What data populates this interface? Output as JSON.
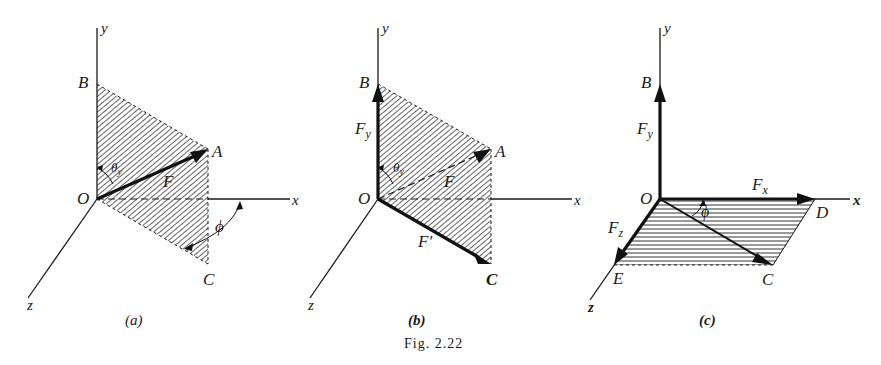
{
  "figure": {
    "caption": "Fig. 2.22",
    "top_fragment": "... components of a vector along the three axes ...",
    "panels": [
      {
        "id": "a",
        "label": "(a)",
        "axes": {
          "x": "x",
          "y": "y",
          "z": "z"
        },
        "points": {
          "origin": "O",
          "B": "B",
          "A": "A",
          "C": "C"
        },
        "vectors": [
          {
            "name": "F",
            "from": "O",
            "to": "A",
            "style": "solid-thick"
          }
        ],
        "angles": [
          {
            "symbol": "θ",
            "subscript": "y",
            "between": [
              "y-axis",
              "F"
            ]
          },
          {
            "symbol": "ϕ",
            "between": [
              "x-axis",
              "OC plane"
            ]
          }
        ],
        "shaded_plane": "OBAC (diagonal hatch)"
      },
      {
        "id": "b",
        "label": "(b)",
        "axes": {
          "x": "x",
          "y": "y",
          "z": "z"
        },
        "points": {
          "origin": "O",
          "B": "B",
          "A": "A",
          "C": "C"
        },
        "vectors": [
          {
            "name": "F",
            "subscript": "y",
            "from": "O",
            "to": "B",
            "style": "solid-thick"
          },
          {
            "name": "F",
            "from": "O",
            "to": "A",
            "style": "dashed"
          },
          {
            "name": "F′",
            "from": "O",
            "to": "C",
            "style": "solid-thick"
          }
        ],
        "angles": [
          {
            "symbol": "θ",
            "subscript": "y",
            "between": [
              "y-axis",
              "F"
            ]
          }
        ],
        "shaded_plane": "OBAC (diagonal hatch)"
      },
      {
        "id": "c",
        "label": "(c)",
        "axes": {
          "x": "x",
          "y": "y",
          "z": "z"
        },
        "points": {
          "origin": "O",
          "B": "B",
          "C": "C",
          "D": "D",
          "E": "E"
        },
        "vectors": [
          {
            "name": "F",
            "subscript": "y",
            "from": "O",
            "to": "B",
            "style": "solid-thick"
          },
          {
            "name": "F",
            "subscript": "x",
            "from": "O",
            "to": "D",
            "style": "solid-thick"
          },
          {
            "name": "F",
            "subscript": "z",
            "from": "O",
            "to": "E",
            "style": "solid-thick"
          },
          {
            "name": "",
            "from": "O",
            "to": "C",
            "style": "solid-medium"
          }
        ],
        "angles": [
          {
            "symbol": "ϕ",
            "between": [
              "x-axis",
              "OC"
            ]
          }
        ],
        "shaded_plane": "ODCE (horizontal hatch)"
      }
    ]
  },
  "text": {
    "x": "x",
    "y": "y",
    "z": "z",
    "O": "O",
    "A": "A",
    "B": "B",
    "C": "C",
    "D": "D",
    "E": "E",
    "F": "F",
    "Fprime": "F′",
    "theta": "θ",
    "sub_y": "y",
    "sub_x": "x",
    "sub_z": "z",
    "phi": "ϕ",
    "label_a": "(a)",
    "label_b": "(b)",
    "label_c": "(c)",
    "caption": "Fig. 2.22"
  }
}
